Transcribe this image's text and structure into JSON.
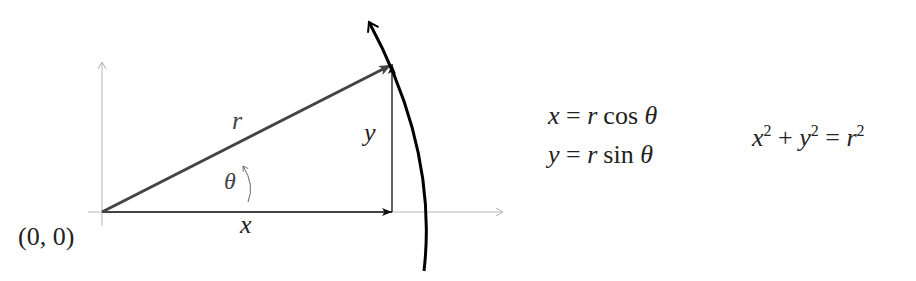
{
  "diagram": {
    "type": "polar-coordinates",
    "origin_label": "(0, 0)",
    "labels": {
      "r": "r",
      "x": "x",
      "y": "y",
      "theta": "θ"
    },
    "geometry": {
      "origin": [
        102,
        212
      ],
      "point": [
        392,
        64
      ],
      "x_axis_end": [
        503,
        212
      ],
      "y_axis_top": [
        102,
        62
      ]
    },
    "colors": {
      "axes": "#b0b0b0",
      "radius_vector": "#444444",
      "components": "#111111",
      "arc": "#000000",
      "text": "#222222"
    }
  },
  "equations": {
    "x_eq": {
      "lhs": "x",
      "eq": "=",
      "rhs_var": "r",
      "fn": "cos",
      "arg": "θ"
    },
    "y_eq": {
      "lhs": "y",
      "eq": "=",
      "rhs_var": "r",
      "fn": "sin",
      "arg": "θ"
    },
    "pythag": {
      "a": "x",
      "b": "y",
      "c": "r",
      "exp": "2",
      "plus": "+",
      "eq": "="
    }
  }
}
